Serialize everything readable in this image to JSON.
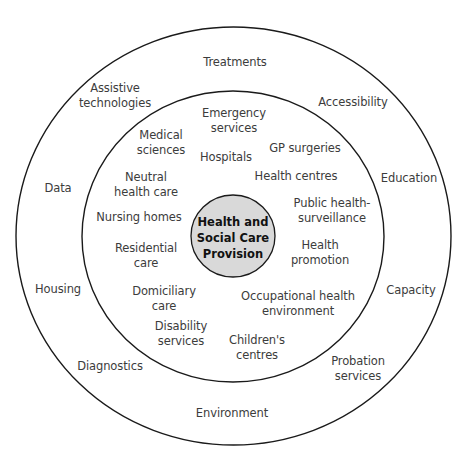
{
  "diagram": {
    "type": "concentric-circles",
    "colors": {
      "stroke": "#1a1a1a",
      "center_fill": "#d9d9d9",
      "text": "#3c3c3c",
      "background": "#ffffff"
    },
    "center": {
      "label": "Health and\nSocial Care\nProvision"
    },
    "inner_ring": {
      "items": [
        {
          "label": "Emergency\nservices"
        },
        {
          "label": "Medical\nsciences"
        },
        {
          "label": "Hospitals"
        },
        {
          "label": "GP surgeries"
        },
        {
          "label": "Neutral\nhealth care"
        },
        {
          "label": "Health centres"
        },
        {
          "label": "Nursing homes"
        },
        {
          "label": "Public health-\nsurveillance"
        },
        {
          "label": "Residential\ncare"
        },
        {
          "label": "Health\npromotion"
        },
        {
          "label": "Domiciliary\ncare"
        },
        {
          "label": "Occupational health\nenvironment"
        },
        {
          "label": "Disability\nservices"
        },
        {
          "label": "Children's\ncentres"
        }
      ]
    },
    "outer_ring": {
      "items": [
        {
          "label": "Treatments"
        },
        {
          "label": "Assistive\ntechnologies"
        },
        {
          "label": "Accessibility"
        },
        {
          "label": "Data"
        },
        {
          "label": "Education"
        },
        {
          "label": "Housing"
        },
        {
          "label": "Capacity"
        },
        {
          "label": "Diagnostics"
        },
        {
          "label": "Probation\nservices"
        },
        {
          "label": "Environment"
        }
      ]
    }
  }
}
